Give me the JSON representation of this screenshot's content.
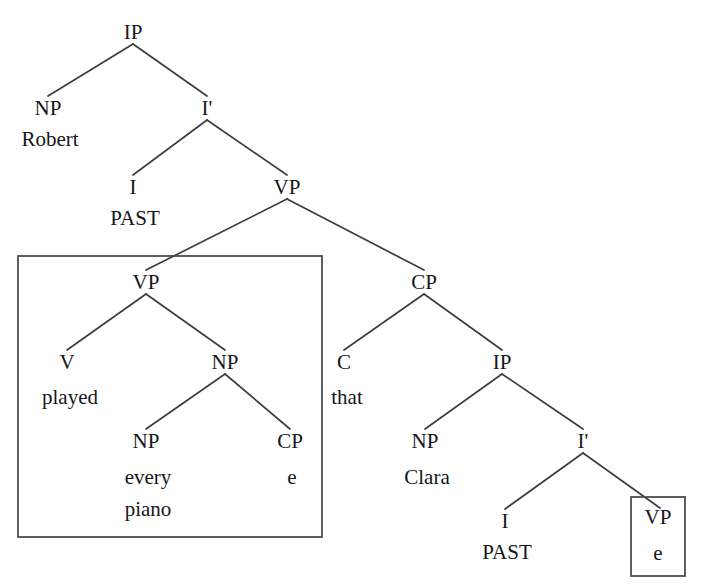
{
  "figure": {
    "type": "syntax-tree",
    "background_color": "#ffffff",
    "line_color": "#3a3d42",
    "text_color": "#14161a",
    "box_border_color": "#4a4d52"
  },
  "nodes": {
    "ip_root": {
      "label": "IP",
      "x": 133,
      "y": 32
    },
    "np_subject": {
      "label": "NP",
      "x": 48,
      "y": 108
    },
    "robert": {
      "label": "Robert",
      "x": 50,
      "y": 139
    },
    "ibar_main": {
      "label": "I'",
      "x": 207,
      "y": 108
    },
    "i_main": {
      "label": "I",
      "x": 133,
      "y": 187
    },
    "past_main": {
      "label": "PAST",
      "x": 135,
      "y": 218
    },
    "vp_upper": {
      "label": "VP",
      "x": 287,
      "y": 187
    },
    "vp_inner": {
      "label": "VP",
      "x": 146,
      "y": 282
    },
    "v_played": {
      "label": "V",
      "x": 67,
      "y": 362
    },
    "played": {
      "label": "played",
      "x": 70,
      "y": 397
    },
    "np_object": {
      "label": "NP",
      "x": 225,
      "y": 362
    },
    "np_every_piano": {
      "label": "NP",
      "x": 146,
      "y": 441
    },
    "every": {
      "label": "every",
      "x": 148,
      "y": 477
    },
    "piano": {
      "label": "piano",
      "x": 148,
      "y": 509
    },
    "cp_empty": {
      "label": "CP",
      "x": 290,
      "y": 441
    },
    "cp_empty_head": {
      "label": "e",
      "x": 292,
      "y": 477
    },
    "cp_relative": {
      "label": "CP",
      "x": 424,
      "y": 282
    },
    "c_that": {
      "label": "C",
      "x": 344,
      "y": 362
    },
    "that": {
      "label": "that",
      "x": 347,
      "y": 397
    },
    "ip_embedded": {
      "label": "IP",
      "x": 502,
      "y": 362
    },
    "np_clara": {
      "label": "NP",
      "x": 425,
      "y": 441
    },
    "clara": {
      "label": "Clara",
      "x": 427,
      "y": 477
    },
    "ibar_embedded": {
      "label": "I'",
      "x": 583,
      "y": 441
    },
    "i_embedded": {
      "label": "I",
      "x": 505,
      "y": 521
    },
    "past_embedded": {
      "label": "PAST",
      "x": 507,
      "y": 552
    },
    "vp_elided": {
      "label": "VP",
      "x": 658,
      "y": 517
    },
    "vp_elided_head": {
      "label": "e",
      "x": 658,
      "y": 553
    }
  },
  "edges": [
    {
      "name": "ip-to-np-subject",
      "x1": 133,
      "y1": 44,
      "x2": 48,
      "y2": 96
    },
    {
      "name": "ip-to-ibar",
      "x1": 133,
      "y1": 44,
      "x2": 207,
      "y2": 96
    },
    {
      "name": "ibar-to-i",
      "x1": 207,
      "y1": 120,
      "x2": 133,
      "y2": 175
    },
    {
      "name": "ibar-to-vp-upper",
      "x1": 207,
      "y1": 120,
      "x2": 287,
      "y2": 175
    },
    {
      "name": "vp-upper-to-vp-inner",
      "x1": 287,
      "y1": 199,
      "x2": 146,
      "y2": 270
    },
    {
      "name": "vp-upper-to-cp-relative",
      "x1": 287,
      "y1": 199,
      "x2": 424,
      "y2": 270
    },
    {
      "name": "vp-inner-to-v",
      "x1": 146,
      "y1": 294,
      "x2": 67,
      "y2": 350
    },
    {
      "name": "vp-inner-to-np-object",
      "x1": 146,
      "y1": 294,
      "x2": 225,
      "y2": 350
    },
    {
      "name": "np-object-to-np-every-piano",
      "x1": 225,
      "y1": 374,
      "x2": 146,
      "y2": 429
    },
    {
      "name": "np-object-to-cp-empty",
      "x1": 225,
      "y1": 374,
      "x2": 290,
      "y2": 429
    },
    {
      "name": "cp-relative-to-c",
      "x1": 424,
      "y1": 294,
      "x2": 344,
      "y2": 350
    },
    {
      "name": "cp-relative-to-ip-embedded",
      "x1": 424,
      "y1": 294,
      "x2": 502,
      "y2": 350
    },
    {
      "name": "ip-embedded-to-np-clara",
      "x1": 502,
      "y1": 374,
      "x2": 425,
      "y2": 429
    },
    {
      "name": "ip-embedded-to-ibar-embedded",
      "x1": 502,
      "y1": 374,
      "x2": 583,
      "y2": 429
    },
    {
      "name": "ibar-embedded-to-i",
      "x1": 583,
      "y1": 453,
      "x2": 505,
      "y2": 509
    },
    {
      "name": "ibar-embedded-to-vp-elided",
      "x1": 583,
      "y1": 453,
      "x2": 660,
      "y2": 508
    }
  ],
  "boxes": [
    {
      "name": "vp-constituent-box",
      "x": 18,
      "y": 256,
      "width": 304,
      "height": 281
    },
    {
      "name": "elided-vp-box",
      "x": 631,
      "y": 497,
      "width": 54,
      "height": 79
    }
  ],
  "sentence": {
    "terminals": [
      "Robert",
      "PAST",
      "played",
      "every",
      "piano",
      "that",
      "Clara",
      "PAST",
      "e"
    ],
    "gloss": "Robert played every piano that Clara did"
  }
}
